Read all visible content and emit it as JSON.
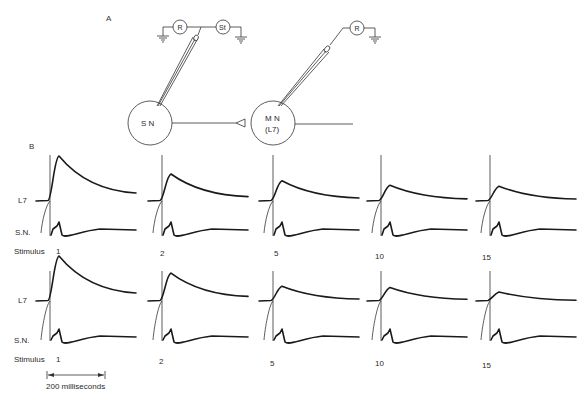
{
  "panel_a": {
    "label": "A",
    "sensory_neuron_label": "S N",
    "motor_neuron_label_line1": "M N",
    "motor_neuron_label_line2": "(L7)",
    "recording_label_1": "R",
    "stimulator_label": "St",
    "recording_label_2": "R"
  },
  "panel_b": {
    "label": "B",
    "row_labels": {
      "l7": "L7",
      "sn": "S.N.",
      "stimulus": "Stimulus"
    },
    "scale_bar": {
      "label": "200 milliseconds",
      "duration_ms": 200
    },
    "rows": [
      {
        "name": "top",
        "stimuli": [
          {
            "number": "1",
            "epsp_relative_amplitude": 1.0
          },
          {
            "number": "2",
            "epsp_relative_amplitude": 0.6
          },
          {
            "number": "5",
            "epsp_relative_amplitude": 0.45
          },
          {
            "number": "10",
            "epsp_relative_amplitude": 0.35
          },
          {
            "number": "15",
            "epsp_relative_amplitude": 0.33
          }
        ]
      },
      {
        "name": "bottom",
        "stimuli": [
          {
            "number": "1",
            "epsp_relative_amplitude": 1.0
          },
          {
            "number": "2",
            "epsp_relative_amplitude": 0.62
          },
          {
            "number": "5",
            "epsp_relative_amplitude": 0.33
          },
          {
            "number": "10",
            "epsp_relative_amplitude": 0.3
          },
          {
            "number": "15",
            "epsp_relative_amplitude": 0.2
          }
        ]
      }
    ]
  }
}
